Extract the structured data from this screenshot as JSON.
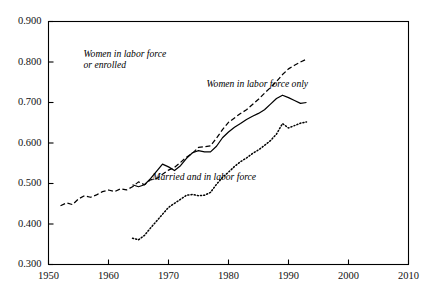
{
  "chart_data": {
    "type": "line",
    "title": "",
    "subtitle": "",
    "xlabel": "",
    "ylabel": "",
    "xlim": [
      1950,
      2010
    ],
    "ylim": [
      0.3,
      0.9
    ],
    "grid": false,
    "legend_position": "inline-annotations",
    "xticks": [
      1950,
      1960,
      1970,
      1980,
      1990,
      2000,
      2010
    ],
    "xtick_labels": [
      "1950",
      "1960",
      "1970",
      "1980",
      "1990",
      "2000",
      "2010"
    ],
    "yticks": [
      0.3,
      0.4,
      0.5,
      0.6,
      0.7,
      0.8,
      0.9
    ],
    "ytick_labels": [
      "0.300",
      "0.400",
      "0.500",
      "0.600",
      "0.700",
      "0.800",
      "0.900"
    ],
    "series": [
      {
        "name": "Women in labor force or enrolled",
        "style": "dashed",
        "color": "#000000",
        "annotation": "Women in labor force\nor enrolled",
        "annotation_x": 1964.5,
        "annotation_y": 0.818,
        "x": [
          1952,
          1953,
          1954,
          1955,
          1956,
          1957,
          1958,
          1959,
          1960,
          1961,
          1962,
          1963,
          1964,
          1965,
          1966,
          1967,
          1968,
          1969,
          1970,
          1971,
          1972,
          1973,
          1974,
          1975,
          1976,
          1977,
          1978,
          1979,
          1980,
          1981,
          1982,
          1983,
          1984,
          1985,
          1986,
          1987,
          1988,
          1989,
          1990,
          1991,
          1992,
          1993
        ],
        "y": [
          0.445,
          0.452,
          0.448,
          0.462,
          0.47,
          0.466,
          0.472,
          0.48,
          0.484,
          0.48,
          0.487,
          0.484,
          0.492,
          0.504,
          0.497,
          0.509,
          0.512,
          0.523,
          0.533,
          0.54,
          0.552,
          0.565,
          0.575,
          0.589,
          0.591,
          0.593,
          0.612,
          0.633,
          0.651,
          0.662,
          0.673,
          0.682,
          0.695,
          0.708,
          0.723,
          0.737,
          0.752,
          0.769,
          0.783,
          0.792,
          0.8,
          0.807
        ]
      },
      {
        "name": "Women in labor force only",
        "style": "solid",
        "color": "#000000",
        "annotation": "Women in labor force only",
        "annotation_x": 1985.0,
        "annotation_y": 0.742,
        "x": [
          1964,
          1965,
          1966,
          1967,
          1968,
          1969,
          1970,
          1971,
          1972,
          1973,
          1974,
          1975,
          1976,
          1977,
          1978,
          1979,
          1980,
          1981,
          1982,
          1983,
          1984,
          1985,
          1986,
          1987,
          1988,
          1989,
          1990,
          1991,
          1992,
          1993
        ],
        "y": [
          0.497,
          0.492,
          0.497,
          0.512,
          0.53,
          0.548,
          0.541,
          0.532,
          0.544,
          0.562,
          0.576,
          0.581,
          0.578,
          0.578,
          0.592,
          0.613,
          0.627,
          0.639,
          0.648,
          0.658,
          0.666,
          0.673,
          0.682,
          0.696,
          0.71,
          0.718,
          0.712,
          0.705,
          0.698,
          0.7
        ]
      },
      {
        "name": "Married and in labor force",
        "style": "dotted",
        "color": "#000000",
        "annotation": "Married and in labor force",
        "annotation_x": 1976.0,
        "annotation_y": 0.513,
        "x": [
          1964,
          1965,
          1966,
          1967,
          1968,
          1969,
          1970,
          1971,
          1972,
          1973,
          1974,
          1975,
          1976,
          1977,
          1978,
          1979,
          1980,
          1981,
          1982,
          1983,
          1984,
          1985,
          1986,
          1987,
          1988,
          1989,
          1990,
          1991,
          1992,
          1993
        ],
        "y": [
          0.365,
          0.361,
          0.372,
          0.39,
          0.407,
          0.424,
          0.441,
          0.451,
          0.461,
          0.471,
          0.473,
          0.47,
          0.471,
          0.478,
          0.498,
          0.515,
          0.528,
          0.542,
          0.554,
          0.563,
          0.574,
          0.583,
          0.594,
          0.606,
          0.622,
          0.648,
          0.637,
          0.643,
          0.649,
          0.652
        ]
      }
    ]
  },
  "axes": {
    "frame_color": "#000000"
  }
}
